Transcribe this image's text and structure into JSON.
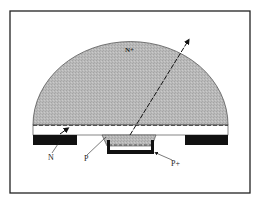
{
  "diagram": {
    "type": "semiconductor-cross-section",
    "labels": {
      "dome": "N+",
      "left_region": "N",
      "center_region": "P",
      "contact": "P+"
    },
    "colors": {
      "dome_fill": "#b8b8b8",
      "metal": "#111111",
      "border": "#222222",
      "background": "#ffffff"
    }
  }
}
